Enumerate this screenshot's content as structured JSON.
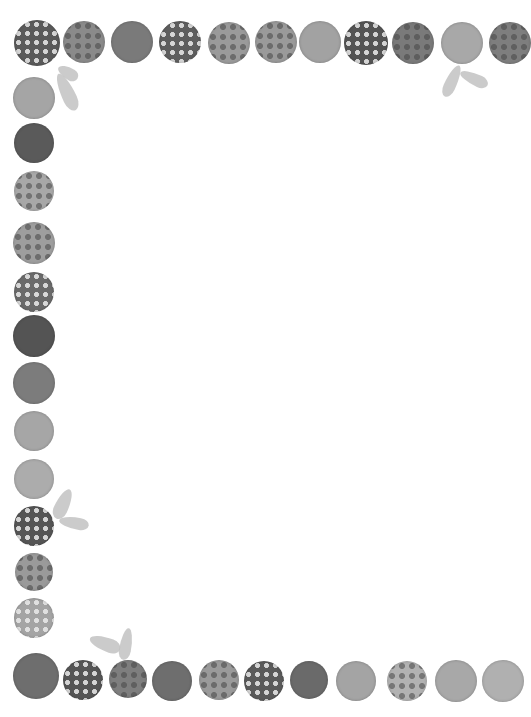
{
  "artwork": {
    "description": "Watercolor-style grayscale polka-dot circle border frame with leaf accents",
    "background": "#ffffff",
    "circles": [
      {
        "x": 37,
        "y": 43,
        "r": 23,
        "color": "#5a5a5a",
        "pattern": "dots"
      },
      {
        "x": 84,
        "y": 42,
        "r": 21,
        "color": "#8a8a8a",
        "pattern": "rings"
      },
      {
        "x": 132,
        "y": 42,
        "r": 21,
        "color": "#7a7a7a",
        "pattern": "none"
      },
      {
        "x": 180,
        "y": 42,
        "r": 21,
        "color": "#5e5e5e",
        "pattern": "dots"
      },
      {
        "x": 229,
        "y": 43,
        "r": 21,
        "color": "#9a9a9a",
        "pattern": "rings"
      },
      {
        "x": 276,
        "y": 42,
        "r": 21,
        "color": "#9a9a9a",
        "pattern": "rings"
      },
      {
        "x": 320,
        "y": 42,
        "r": 21,
        "color": "#a2a2a2",
        "pattern": "none"
      },
      {
        "x": 366,
        "y": 43,
        "r": 22,
        "color": "#545454",
        "pattern": "dots"
      },
      {
        "x": 413,
        "y": 43,
        "r": 21,
        "color": "#7a7a7a",
        "pattern": "rings"
      },
      {
        "x": 462,
        "y": 43,
        "r": 21,
        "color": "#a8a8a8",
        "pattern": "none"
      },
      {
        "x": 510,
        "y": 43,
        "r": 21,
        "color": "#7e7e7e",
        "pattern": "rings"
      },
      {
        "x": 34,
        "y": 98,
        "r": 21,
        "color": "#a5a5a5",
        "pattern": "none"
      },
      {
        "x": 34,
        "y": 143,
        "r": 20,
        "color": "#5a5a5a",
        "pattern": "none"
      },
      {
        "x": 34,
        "y": 191,
        "r": 20,
        "color": "#a8a8a8",
        "pattern": "rings"
      },
      {
        "x": 34,
        "y": 243,
        "r": 21,
        "color": "#9e9e9e",
        "pattern": "rings"
      },
      {
        "x": 34,
        "y": 292,
        "r": 20,
        "color": "#6a6a6a",
        "pattern": "dots"
      },
      {
        "x": 34,
        "y": 336,
        "r": 21,
        "color": "#545454",
        "pattern": "none"
      },
      {
        "x": 34,
        "y": 383,
        "r": 21,
        "color": "#7c7c7c",
        "pattern": "none"
      },
      {
        "x": 34,
        "y": 431,
        "r": 20,
        "color": "#a6a6a6",
        "pattern": "none"
      },
      {
        "x": 34,
        "y": 479,
        "r": 20,
        "color": "#acacac",
        "pattern": "none"
      },
      {
        "x": 34,
        "y": 526,
        "r": 20,
        "color": "#555555",
        "pattern": "dots"
      },
      {
        "x": 34,
        "y": 572,
        "r": 19,
        "color": "#9a9a9a",
        "pattern": "rings"
      },
      {
        "x": 34,
        "y": 618,
        "r": 20,
        "color": "#a4a4a4",
        "pattern": "dots"
      },
      {
        "x": 36,
        "y": 676,
        "r": 23,
        "color": "#6e6e6e",
        "pattern": "none"
      },
      {
        "x": 83,
        "y": 680,
        "r": 20,
        "color": "#555555",
        "pattern": "dots"
      },
      {
        "x": 128,
        "y": 679,
        "r": 19,
        "color": "#7e7e7e",
        "pattern": "rings"
      },
      {
        "x": 172,
        "y": 681,
        "r": 20,
        "color": "#6e6e6e",
        "pattern": "none"
      },
      {
        "x": 219,
        "y": 680,
        "r": 20,
        "color": "#9a9a9a",
        "pattern": "rings"
      },
      {
        "x": 264,
        "y": 681,
        "r": 20,
        "color": "#5a5a5a",
        "pattern": "dots"
      },
      {
        "x": 309,
        "y": 680,
        "r": 19,
        "color": "#6a6a6a",
        "pattern": "none"
      },
      {
        "x": 356,
        "y": 681,
        "r": 20,
        "color": "#a4a4a4",
        "pattern": "none"
      },
      {
        "x": 407,
        "y": 681,
        "r": 20,
        "color": "#b2b2b2",
        "pattern": "rings"
      },
      {
        "x": 456,
        "y": 681,
        "r": 21,
        "color": "#a8a8a8",
        "pattern": "none"
      },
      {
        "x": 503,
        "y": 681,
        "r": 21,
        "color": "#b0b0b0",
        "pattern": "none"
      }
    ],
    "leaves": [
      {
        "x": 62,
        "y": 62,
        "w": 12,
        "h": 22,
        "rot": -60
      },
      {
        "x": 60,
        "y": 72,
        "w": 14,
        "h": 40,
        "rot": -25
      },
      {
        "x": 446,
        "y": 64,
        "w": 12,
        "h": 34,
        "rot": 25
      },
      {
        "x": 468,
        "y": 64,
        "w": 12,
        "h": 30,
        "rot": -65
      },
      {
        "x": 56,
        "y": 488,
        "w": 14,
        "h": 32,
        "rot": 25
      },
      {
        "x": 68,
        "y": 508,
        "w": 12,
        "h": 30,
        "rot": -80
      },
      {
        "x": 98,
        "y": 628,
        "w": 14,
        "h": 32,
        "rot": -70
      },
      {
        "x": 120,
        "y": 628,
        "w": 12,
        "h": 32,
        "rot": 10
      }
    ]
  }
}
